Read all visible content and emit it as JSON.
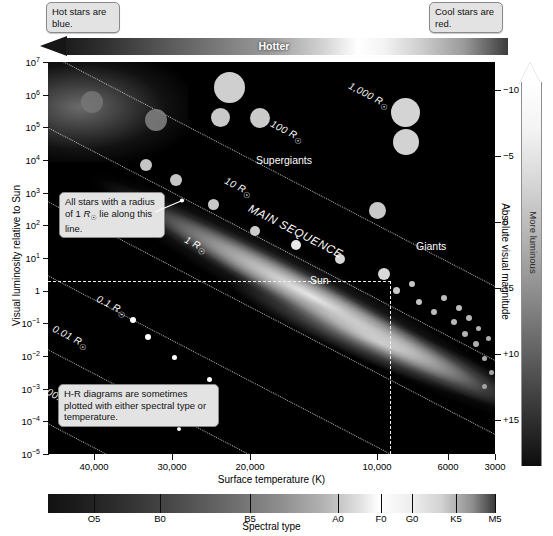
{
  "callouts": {
    "hot": "Hot stars are blue.",
    "cool": "Cool stars are red.",
    "radius": "All stars with a radius of 1 R⊙ lie along this line.",
    "hr": "H-R diagrams are sometimes plotted with either spectral type or temperature."
  },
  "arrows": {
    "hotter_label": "Hotter",
    "luminous_label": "More luminous"
  },
  "axes": {
    "y_title": "Visual luminosity relative to Sun",
    "y2_title": "Absolute visual magnitude",
    "x_title": "Surface temperature (K)",
    "spectral_title": "Spectral type"
  },
  "plot_labels": {
    "supergiants": "Supergiants",
    "giants": "Giants",
    "main_sequence": "MAIN SEQUENCE",
    "white_dwarfs_line1": "White",
    "white_dwarfs_line2": "Dwarfs",
    "sun": "Sun"
  },
  "chart_data": {
    "type": "scatter",
    "xlabel": "Surface temperature (K)",
    "ylabel": "Visual luminosity relative to Sun",
    "y2label": "Absolute visual magnitude",
    "xlim": [
      42000,
      2800
    ],
    "ylim": [
      1e-05,
      10000000.0
    ],
    "x_ticks": [
      "40,000",
      "30,000",
      "20,000",
      "10,000",
      "6000",
      "3000"
    ],
    "x_tick_values": [
      40000,
      30000,
      20000,
      10000,
      6000,
      3000
    ],
    "y_ticks": [
      "10⁷",
      "10⁶",
      "10⁵",
      "10⁴",
      "10³",
      "10²",
      "10¹",
      "1",
      "10⁻¹",
      "10⁻²",
      "10⁻³",
      "10⁻⁴",
      "10⁻⁵"
    ],
    "y_tick_values": [
      10000000.0,
      1000000.0,
      100000.0,
      10000.0,
      1000.0,
      100.0,
      10.0,
      1,
      0.1,
      0.01,
      0.001,
      0.0001,
      1e-05
    ],
    "y2_ticks": [
      "−10",
      "−5",
      "0",
      "+5",
      "+10",
      "+15"
    ],
    "y2_tick_values": [
      -10,
      -5,
      0,
      5,
      10,
      15
    ],
    "spectral_ticks": [
      "O5",
      "B0",
      "B5",
      "A0",
      "F0",
      "G0",
      "K5",
      "M5"
    ],
    "radius_lines": [
      "1,000 R⊙",
      "100 R⊙",
      "10 R⊙",
      "1 R⊙",
      "0.1 R⊙",
      "0.01 R⊙",
      "0.001 R⊙"
    ],
    "groups": [
      "Supergiants",
      "Giants",
      "MAIN SEQUENCE",
      "White Dwarfs",
      "Sun"
    ],
    "sun_point": {
      "temperature": 5800,
      "luminosity": 1,
      "magnitude": 4.8
    },
    "legend": "none",
    "grid": "radius isolines (dotted)"
  },
  "ytick_labels": [
    {
      "m": "10",
      "e": "7"
    },
    {
      "m": "10",
      "e": "6"
    },
    {
      "m": "10",
      "e": "5"
    },
    {
      "m": "10",
      "e": "4"
    },
    {
      "m": "10",
      "e": "3"
    },
    {
      "m": "10",
      "e": "2"
    },
    {
      "m": "10",
      "e": "1"
    },
    {
      "m": "1",
      "e": ""
    },
    {
      "m": "10",
      "e": "−1"
    },
    {
      "m": "10",
      "e": "−2"
    },
    {
      "m": "10",
      "e": "−3"
    },
    {
      "m": "10",
      "e": "−4"
    },
    {
      "m": "10",
      "e": "−5"
    }
  ],
  "y2tick_labels": [
    "−10",
    "−5",
    "0",
    "+5",
    "+10",
    "+15"
  ],
  "xtick_labels": [
    "40,000",
    "30,000",
    "20,000",
    "10,000",
    "6000",
    "3000"
  ],
  "spectral_labels": [
    "O5",
    "B0",
    "B5",
    "A0",
    "F0",
    "G0",
    "K5",
    "M5"
  ],
  "radius_labels": [
    "1,000 R",
    "100 R",
    "10 R",
    "1 R",
    "0.1 R",
    "0.01 R",
    "0.001 R"
  ],
  "colors": {
    "plot_background": "#000000",
    "isoline": "#cfcfcf",
    "star": "#d9d9d9",
    "callout_bg": "#e3e3e3"
  }
}
